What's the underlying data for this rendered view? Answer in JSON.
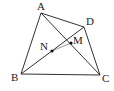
{
  "diagram": {
    "type": "geometry",
    "points": {
      "A": {
        "label": "A",
        "x": 41,
        "y": 13
      },
      "B": {
        "label": "B",
        "x": 21,
        "y": 74
      },
      "C": {
        "label": "C",
        "x": 100,
        "y": 75
      },
      "D": {
        "label": "D",
        "x": 84,
        "y": 27
      },
      "M": {
        "label": "M",
        "x": 71,
        "y": 43
      },
      "N": {
        "label": "N",
        "x": 52,
        "y": 51
      }
    },
    "segments": [
      "AB",
      "BC",
      "CD",
      "DA",
      "AC",
      "BD",
      "MN"
    ],
    "labels": {
      "A": "A",
      "B": "B",
      "C": "C",
      "D": "D",
      "M": "M",
      "N": "N"
    }
  }
}
